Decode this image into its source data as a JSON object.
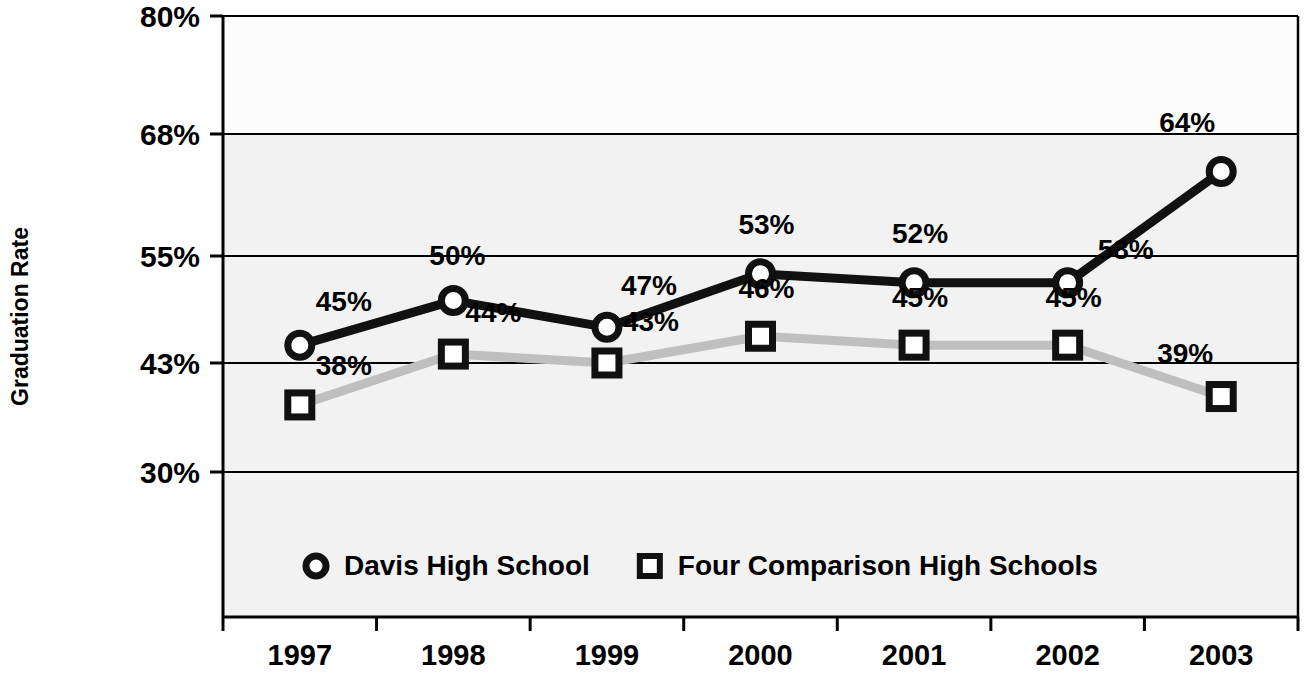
{
  "chart_data": {
    "type": "line",
    "title": "",
    "xlabel": "",
    "ylabel": "Graduation Rate",
    "categories": [
      "1997",
      "1998",
      "1999",
      "2000",
      "2001",
      "2002",
      "2003"
    ],
    "ytick_labels": [
      "80%",
      "68%",
      "55%",
      "43%",
      "30%"
    ],
    "ytick_values": [
      80,
      68,
      55,
      43,
      30
    ],
    "ylim": [
      30,
      80
    ],
    "grid": true,
    "legend_position": "inside-bottom",
    "series": [
      {
        "name": "Davis High School",
        "marker": "circle",
        "color": "#111111",
        "values": [
          45,
          50,
          47,
          53,
          52,
          52,
          64
        ],
        "labels": [
          "45%",
          "50%",
          "47%",
          "53%",
          "52%",
          "58%",
          "64%"
        ]
      },
      {
        "name": "Four Comparison High Schools",
        "marker": "square",
        "color": "#bfbfbf",
        "values": [
          38,
          44,
          43,
          46,
          45,
          45,
          39
        ],
        "labels": [
          "38%",
          "44%",
          "43%",
          "46%",
          "45%",
          "45%",
          "39%"
        ]
      }
    ]
  },
  "legend": {
    "items": [
      {
        "label": "Davis High School",
        "marker": "circle"
      },
      {
        "label": "Four Comparison High Schools",
        "marker": "square"
      }
    ]
  },
  "colors": {
    "davis_line": "#111111",
    "comparison_line": "#bfbfbf",
    "plot_background": "#f2f2f2",
    "plot_background_top": "#fcfcfc",
    "axis": "#000000"
  }
}
